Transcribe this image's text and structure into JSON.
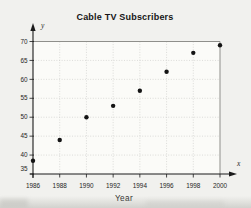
{
  "figure": {
    "background": "#f1f1ee",
    "plot_background": "#fbfbf8",
    "ink_color": "#1b1b1b",
    "frame_color": "#8f8f8b",
    "grid_color": "#cfcfcb",
    "point_color": "#141414"
  },
  "chart_data": {
    "type": "scatter",
    "title": "Cable TV Subscribers",
    "xlabel": "Year",
    "ylabel": "",
    "x_axis_letter": "x",
    "y_axis_letter": "y",
    "x": [
      1986,
      1988,
      1990,
      1992,
      1994,
      1996,
      1998,
      2000
    ],
    "y": [
      38.5,
      44,
      50,
      53,
      57,
      62,
      67,
      69
    ],
    "x_ticks": [
      "1986",
      "1988",
      "1990",
      "1992",
      "1994",
      "1996",
      "1998",
      "2000"
    ],
    "y_ticks": [
      35,
      40,
      45,
      50,
      55,
      60,
      65,
      70
    ],
    "xlim": [
      1986,
      2000
    ],
    "ylim": [
      35,
      70
    ],
    "grid": true,
    "legend": "none"
  }
}
